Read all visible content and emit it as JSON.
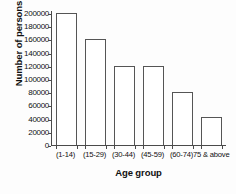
{
  "chart_data": {
    "type": "bar",
    "title": "",
    "xlabel": "Age group",
    "ylabel": "Number of persons",
    "categories": [
      "(1-14)",
      "(15-29)",
      "(30-44)",
      "(45-59)",
      "(60-74)",
      "75 & above"
    ],
    "values": [
      200000,
      160000,
      120000,
      120000,
      80000,
      42000
    ],
    "ylim": [
      0,
      200000
    ],
    "ytick_values": [
      0,
      20000,
      40000,
      60000,
      80000,
      100000,
      120000,
      140000,
      160000,
      180000,
      200000
    ],
    "ytick_labels": [
      "0",
      "20000",
      "40000",
      "60000",
      "80000",
      "100000",
      "120000",
      "140000",
      "160000",
      "180000",
      "200000"
    ],
    "grid": false,
    "legend": false,
    "bar_fill_color": "#ffffff",
    "bar_edge_color": "#555555",
    "axis_color": "#4a4a4a"
  }
}
